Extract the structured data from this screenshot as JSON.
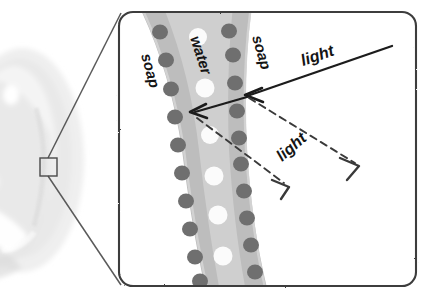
{
  "figure": {
    "type": "illustration-diagram",
    "background_color": "#ffffff"
  },
  "photo": {
    "name": "soap-bubble-photograph",
    "description": "faint grayscale soap bubble",
    "highlight_color": "#ffffff",
    "body_color": "#ededed",
    "shade_color": "#e3e3e3"
  },
  "callout": {
    "square_label": "",
    "line_color": "#5a5a5a",
    "square_stroke": "#4a4a4a"
  },
  "frame": {
    "stroke_color": "#3c3c3c",
    "fill_color": "#ffffff",
    "corner_radius": 14
  },
  "film": {
    "band_color": "#bdbdbd",
    "inner_color": "#cdcdcd",
    "soap_dot_color": "#6f6f6f",
    "water_dot_color": "#fbfbfb"
  },
  "labels": {
    "soap_left": "soap",
    "water": "water",
    "soap_right": "soap",
    "light_incoming": "light",
    "light_reflected": "light"
  },
  "rays": {
    "incoming_color": "#1b1b1b",
    "reflected_color": "#3a3a3a",
    "reflected_style": "dashed",
    "arrowhead_style": "open-v"
  },
  "colors": {
    "ink": "#141414",
    "gray_band": "#bdbdbd",
    "soap_dot": "#6f6f6f",
    "water_dot": "#fbfbfb",
    "frame": "#3c3c3c"
  }
}
